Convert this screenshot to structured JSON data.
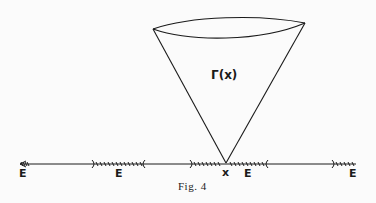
{
  "figure": {
    "caption": "Fig. 4",
    "cone_label": "Γ(x)",
    "point_label": "x",
    "set_labels": [
      "E",
      "E",
      "E",
      "E"
    ],
    "colors": {
      "ink": "#1a1a1a",
      "background": "#fbfbfb"
    }
  }
}
